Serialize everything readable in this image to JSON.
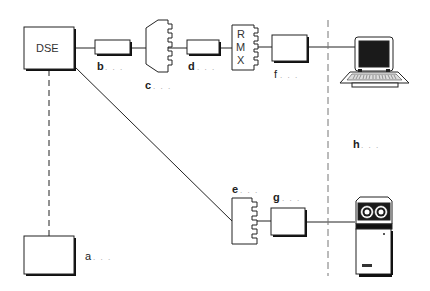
{
  "diagram": {
    "type": "network-connection-diagram",
    "nodes": {
      "dse": {
        "label": "DSE"
      },
      "a": {
        "label": "a",
        "suffix": ". . ."
      },
      "b": {
        "label": "b",
        "suffix": ". . ."
      },
      "c": {
        "label": "c",
        "suffix": ". . ."
      },
      "d": {
        "label": "d",
        "suffix": ". . ."
      },
      "rmx": {
        "letters": [
          "R",
          "M",
          "X"
        ]
      },
      "e": {
        "label": "e",
        "suffix": ". . ."
      },
      "f": {
        "label": "f",
        "suffix": ". . ."
      },
      "g": {
        "label": "g",
        "suffix": ". . ."
      },
      "h": {
        "label": "h",
        "suffix": ". . ."
      },
      "laptop": {
        "icon": "laptop-icon"
      },
      "device": {
        "icon": "terminal-device-icon"
      }
    },
    "edges": [
      {
        "from": "dse",
        "to": "a",
        "style": "dashed"
      },
      {
        "from": "dse",
        "to": "b",
        "style": "solid"
      },
      {
        "from": "b",
        "to": "c",
        "style": "solid"
      },
      {
        "from": "c",
        "to": "d",
        "style": "solid"
      },
      {
        "from": "d",
        "to": "rmx",
        "style": "solid"
      },
      {
        "from": "rmx",
        "to": "f",
        "style": "solid"
      },
      {
        "from": "f",
        "to": "laptop",
        "style": "solid"
      },
      {
        "from": "dse",
        "to": "e",
        "style": "solid"
      },
      {
        "from": "e",
        "to": "g",
        "style": "solid"
      },
      {
        "from": "g",
        "to": "device",
        "style": "solid"
      }
    ],
    "boundary": {
      "style": "dashed",
      "label_ref": "h"
    },
    "colors": {
      "line": "#222222",
      "shadow": "#111111",
      "screen": "#1a1a1a",
      "dots": "#999999"
    }
  }
}
